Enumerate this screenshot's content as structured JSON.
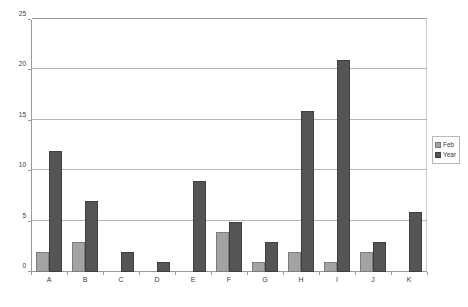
{
  "chart_data": {
    "type": "bar",
    "title": "",
    "subtitle": "",
    "xlabel": "",
    "ylabel": "",
    "categories": [
      "A",
      "B",
      "C",
      "D",
      "E",
      "F",
      "G",
      "H",
      "I",
      "J",
      "K"
    ],
    "series": [
      {
        "name": "Feb",
        "color": "#a3a3a3",
        "values": [
          2,
          3,
          0,
          0,
          0,
          4,
          1,
          2,
          1,
          2,
          0
        ]
      },
      {
        "name": "Year",
        "color": "#555555",
        "values": [
          12,
          7,
          2,
          1,
          9,
          5,
          3,
          16,
          21,
          3,
          6
        ]
      }
    ],
    "ylim": [
      0,
      25
    ],
    "yticks": [
      0,
      5,
      10,
      15,
      20,
      25
    ],
    "ytick_labels": [
      "0",
      "5",
      "10",
      "15",
      "20",
      "25"
    ],
    "grid": true,
    "grid_axis": "y",
    "legend_position": "right",
    "legend_entries": [
      "Feb",
      "Year"
    ],
    "bar_grouping": "grouped"
  }
}
